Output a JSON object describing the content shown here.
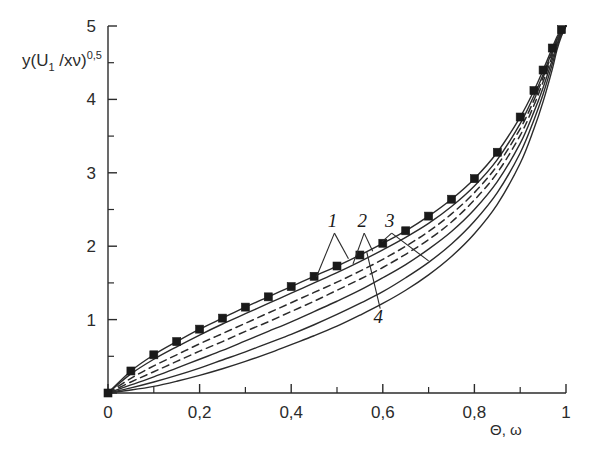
{
  "figure": {
    "background_color": "#ffffff",
    "ink_color": "#2b2b2b"
  },
  "chart_data": {
    "type": "line",
    "title": "",
    "subtitle": "",
    "xlabel": "Θ, ω",
    "ylabel": "y(U₁ /xν)⁰'⁵",
    "ylabel_parts": {
      "main_a": "y(U",
      "sub": "1",
      "main_b": " /xν)",
      "sup": "0,5"
    },
    "xlim": [
      0,
      1
    ],
    "ylim": [
      0,
      5
    ],
    "grid": false,
    "legend": "none",
    "x_ticks_major": [
      0,
      0.2,
      0.4,
      0.6,
      0.8,
      1
    ],
    "x_tick_labels": [
      "0",
      "0,2",
      "0,4",
      "0,6",
      "0,8",
      "1"
    ],
    "x_ticks_minor": [
      0.1,
      0.3,
      0.5,
      0.7,
      0.9
    ],
    "y_ticks_major": [
      0,
      1,
      2,
      3,
      4,
      5
    ],
    "y_tick_labels": [
      "",
      "1",
      "2",
      "3",
      "4",
      "5"
    ],
    "y_ticks_minor": [
      0.5,
      1.5,
      2.5,
      3.5,
      4.5
    ],
    "x": [
      0,
      0.05,
      0.1,
      0.15,
      0.2,
      0.25,
      0.3,
      0.35,
      0.4,
      0.45,
      0.5,
      0.55,
      0.6,
      0.65,
      0.7,
      0.75,
      0.8,
      0.85,
      0.9,
      0.93,
      0.95,
      0.97,
      0.98,
      0.99,
      1
    ],
    "series": [
      {
        "name": "curve-markers",
        "style": "solid-with-markers",
        "marker": "filled-square",
        "values": [
          0,
          0.3,
          0.52,
          0.7,
          0.87,
          1.02,
          1.17,
          1.31,
          1.45,
          1.59,
          1.73,
          1.88,
          2.04,
          2.21,
          2.41,
          2.64,
          2.92,
          3.28,
          3.76,
          4.12,
          4.4,
          4.7,
          4.85,
          4.95,
          5.0
        ],
        "marker_x": [
          0,
          0.05,
          0.1,
          0.15,
          0.2,
          0.25,
          0.3,
          0.35,
          0.4,
          0.45,
          0.5,
          0.55,
          0.6,
          0.65,
          0.7,
          0.75,
          0.8,
          0.85,
          0.9,
          0.93,
          0.95,
          0.97,
          0.99
        ],
        "marker_y": [
          0,
          0.3,
          0.52,
          0.7,
          0.87,
          1.02,
          1.17,
          1.31,
          1.45,
          1.59,
          1.73,
          1.88,
          2.04,
          2.21,
          2.41,
          2.64,
          2.92,
          3.28,
          3.76,
          4.12,
          4.4,
          4.7,
          4.95
        ]
      },
      {
        "name": "curve-1",
        "style": "solid",
        "values": [
          0,
          0.26,
          0.46,
          0.63,
          0.79,
          0.94,
          1.08,
          1.22,
          1.36,
          1.5,
          1.64,
          1.79,
          1.95,
          2.12,
          2.31,
          2.54,
          2.82,
          3.18,
          3.67,
          4.05,
          4.34,
          4.66,
          4.82,
          4.93,
          5.0
        ]
      },
      {
        "name": "curve-2-dashed",
        "style": "dashed",
        "values": [
          0,
          0.2,
          0.37,
          0.52,
          0.67,
          0.81,
          0.95,
          1.09,
          1.23,
          1.37,
          1.51,
          1.66,
          1.82,
          2.0,
          2.2,
          2.44,
          2.73,
          3.1,
          3.6,
          3.99,
          4.3,
          4.63,
          4.8,
          4.92,
          5.0
        ]
      },
      {
        "name": "curve-3-dashed",
        "style": "dashed",
        "values": [
          0,
          0.15,
          0.29,
          0.43,
          0.57,
          0.7,
          0.84,
          0.97,
          1.11,
          1.25,
          1.4,
          1.55,
          1.71,
          1.89,
          2.09,
          2.33,
          2.63,
          3.0,
          3.51,
          3.92,
          4.24,
          4.59,
          4.78,
          4.91,
          5.0
        ]
      },
      {
        "name": "curve-4-solid-mid",
        "style": "solid",
        "values": [
          0,
          0.11,
          0.22,
          0.34,
          0.46,
          0.58,
          0.71,
          0.84,
          0.97,
          1.11,
          1.25,
          1.4,
          1.57,
          1.75,
          1.96,
          2.2,
          2.5,
          2.88,
          3.4,
          3.83,
          4.16,
          4.54,
          4.75,
          4.9,
          5.0
        ]
      },
      {
        "name": "curve-5-solid-lower",
        "style": "solid",
        "values": [
          0,
          0.07,
          0.15,
          0.24,
          0.34,
          0.45,
          0.56,
          0.68,
          0.8,
          0.93,
          1.07,
          1.22,
          1.38,
          1.57,
          1.78,
          2.03,
          2.34,
          2.73,
          3.27,
          3.72,
          4.07,
          4.48,
          4.71,
          4.88,
          5.0
        ]
      },
      {
        "name": "curve-6-solid-lowest",
        "style": "solid",
        "values": [
          0,
          0.04,
          0.09,
          0.16,
          0.24,
          0.33,
          0.43,
          0.54,
          0.66,
          0.78,
          0.91,
          1.06,
          1.22,
          1.4,
          1.61,
          1.86,
          2.17,
          2.57,
          3.13,
          3.6,
          3.97,
          4.41,
          4.67,
          4.86,
          5.0
        ]
      }
    ],
    "annotations": [
      {
        "label": "1",
        "x": 0.49,
        "y": 2.26
      },
      {
        "label": "2",
        "x": 0.555,
        "y": 2.26
      },
      {
        "label": "3",
        "x": 0.615,
        "y": 2.26
      },
      {
        "label": "4",
        "x": 0.59,
        "y": 0.96
      }
    ]
  }
}
